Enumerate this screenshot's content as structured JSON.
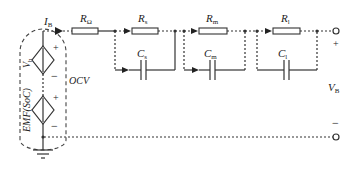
{
  "diagram": {
    "type": "equivalent-circuit",
    "labels": {
      "current": {
        "main": "I",
        "sub": "B"
      },
      "r_ohm": {
        "main": "R",
        "sub": "Ω"
      },
      "r_s": {
        "main": "R",
        "sub": "s"
      },
      "r_m": {
        "main": "R",
        "sub": "m"
      },
      "r_l": {
        "main": "R",
        "sub": "l"
      },
      "c_s": {
        "main": "C",
        "sub": "s"
      },
      "c_m": {
        "main": "C",
        "sub": "m"
      },
      "c_l": {
        "main": "C",
        "sub": "l"
      },
      "v_h": {
        "main": "V",
        "sub": "h"
      },
      "emf": "EMF(SoC)",
      "ocv": "OCV",
      "v_b": {
        "main": "V",
        "sub": "B"
      },
      "plus": "+",
      "minus": "−"
    },
    "components": [
      {
        "id": "hysteresis-source",
        "kind": "dependent-voltage-source",
        "label": "V_h"
      },
      {
        "id": "emf-source",
        "kind": "dependent-voltage-source",
        "label": "EMF(SoC)"
      },
      {
        "id": "ohmic-resistor",
        "kind": "resistor",
        "label": "R_Ω"
      },
      {
        "id": "rc-short",
        "kind": "rc-pair",
        "resistor": "R_s",
        "capacitor": "C_s"
      },
      {
        "id": "rc-medium",
        "kind": "rc-pair",
        "resistor": "R_m",
        "capacitor": "C_m"
      },
      {
        "id": "rc-long",
        "kind": "rc-pair",
        "resistor": "R_l",
        "capacitor": "C_l"
      },
      {
        "id": "ground",
        "kind": "ground"
      },
      {
        "id": "terminal-positive",
        "kind": "terminal",
        "label": "+"
      },
      {
        "id": "terminal-negative",
        "kind": "terminal",
        "label": "−"
      }
    ],
    "colors": {
      "line": "#333333",
      "background": "#ffffff"
    }
  }
}
